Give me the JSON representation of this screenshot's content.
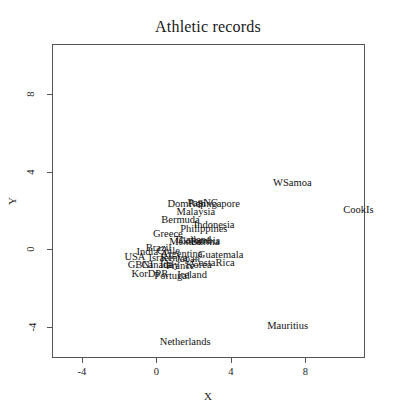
{
  "chart_data": {
    "type": "scatter",
    "title": "Athletic records",
    "xlabel": "X",
    "ylabel": "Y",
    "xlim": [
      -5.6,
      11.2
    ],
    "ylim": [
      -5.6,
      10.6
    ],
    "xticks": [
      -4,
      0,
      4,
      8
    ],
    "yticks": [
      -4,
      0,
      4,
      8
    ],
    "xtick_labels": [
      "-4",
      "0",
      "4",
      "8"
    ],
    "ytick_labels": [
      "-4",
      "0",
      "4",
      "8"
    ],
    "grid": false,
    "legend": false,
    "point_marker": "text-label",
    "points": [
      {
        "label": "WSamoa",
        "x": 7.3,
        "y": 3.45
      },
      {
        "label": "CookIs",
        "x": 10.85,
        "y": 2.05
      },
      {
        "label": "Mauritius",
        "x": 7.05,
        "y": -3.95
      },
      {
        "label": "Netherlands",
        "x": 1.55,
        "y": -4.75
      },
      {
        "label": "DomRep",
        "x": 1.62,
        "y": 2.35
      },
      {
        "label": "PapNG",
        "x": 2.5,
        "y": 2.42
      },
      {
        "label": "Singapore",
        "x": 3.35,
        "y": 2.32
      },
      {
        "label": "Malaysia",
        "x": 2.12,
        "y": 1.92
      },
      {
        "label": "Bermuda",
        "x": 1.3,
        "y": 1.52
      },
      {
        "label": "Indonesia",
        "x": 3.1,
        "y": 1.28
      },
      {
        "label": "Philippines",
        "x": 2.55,
        "y": 1.05
      },
      {
        "label": "Greece",
        "x": 0.62,
        "y": 0.82
      },
      {
        "label": "Thailand",
        "x": 1.95,
        "y": 0.48
      },
      {
        "label": "Colombia",
        "x": 2.32,
        "y": 0.42
      },
      {
        "label": "Mexico",
        "x": 1.55,
        "y": 0.4
      },
      {
        "label": "Burma",
        "x": 2.62,
        "y": 0.38
      },
      {
        "label": "Brazil",
        "x": 0.12,
        "y": 0.1
      },
      {
        "label": "India",
        "x": -0.48,
        "y": -0.12
      },
      {
        "label": "Chile",
        "x": 0.65,
        "y": -0.08
      },
      {
        "label": "Argentina",
        "x": 1.35,
        "y": -0.22
      },
      {
        "label": "Guatemala",
        "x": 3.45,
        "y": -0.28
      },
      {
        "label": "USA",
        "x": -1.15,
        "y": -0.4
      },
      {
        "label": "Israel",
        "x": 0.2,
        "y": -0.42
      },
      {
        "label": "Kenya",
        "x": 0.95,
        "y": -0.46
      },
      {
        "label": "Japan",
        "x": 1.7,
        "y": -0.48
      },
      {
        "label": "CostaRica",
        "x": 3.05,
        "y": -0.72
      },
      {
        "label": "GBNI",
        "x": -0.85,
        "y": -0.78
      },
      {
        "label": "Canada",
        "x": 0.05,
        "y": -0.8
      },
      {
        "label": "Italy",
        "x": 0.72,
        "y": -0.82
      },
      {
        "label": "France",
        "x": 1.28,
        "y": -0.84
      },
      {
        "label": "Korea",
        "x": 2.28,
        "y": -0.8
      },
      {
        "label": "KorDPR",
        "x": -0.35,
        "y": -1.28
      },
      {
        "label": "Portugal",
        "x": 0.85,
        "y": -1.35
      },
      {
        "label": "Ireland",
        "x": 1.92,
        "y": -1.3
      }
    ]
  }
}
